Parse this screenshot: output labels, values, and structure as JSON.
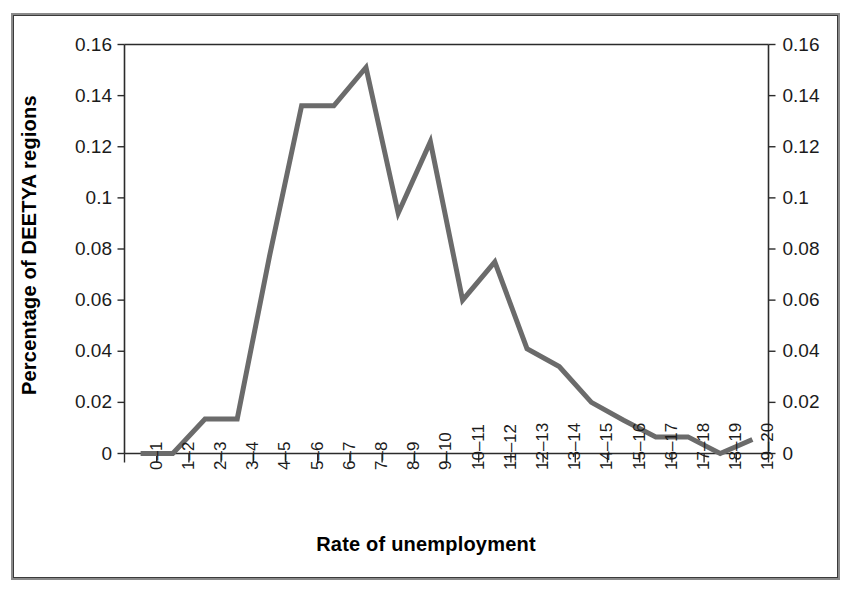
{
  "chart_data": {
    "type": "line",
    "title": "",
    "xlabel": "Rate of unemployment",
    "ylabel": "Percentage of DEETYA regions",
    "categories": [
      "0–1",
      "1–2",
      "2–3",
      "3–4",
      "4–5",
      "5–6",
      "6–7",
      "7–8",
      "8–9",
      "9–10",
      "10–11",
      "11–12",
      "12–13",
      "13–14",
      "14–15",
      "15–16",
      "16–17",
      "17–18",
      "18–19",
      "19–20"
    ],
    "values": [
      0,
      0,
      0.0135,
      0.0135,
      0.077,
      0.136,
      0.136,
      0.151,
      0.094,
      0.122,
      0.06,
      0.075,
      0.041,
      0.034,
      0.02,
      0.013,
      0.0065,
      0.0065,
      0,
      0.0055
    ],
    "series": [
      {
        "name": "Percentage of DEETYA regions",
        "values": [
          0,
          0,
          0.0135,
          0.0135,
          0.077,
          0.136,
          0.136,
          0.151,
          0.094,
          0.122,
          0.06,
          0.075,
          0.041,
          0.034,
          0.02,
          0.013,
          0.0065,
          0.0065,
          0,
          0.0055
        ],
        "color": "#6b6b6b"
      }
    ],
    "ylim": [
      0,
      0.16
    ],
    "yticks": [
      0,
      0.02,
      0.04,
      0.06,
      0.08,
      0.1,
      0.12,
      0.14,
      0.16
    ],
    "ytick_labels": [
      "0",
      "0.02",
      "0.04",
      "0.06",
      "0.08",
      "0.1",
      "0.12",
      "0.14",
      "0.16"
    ],
    "ytick_labels_right": [
      "0",
      "0.02",
      "0.04",
      "0.06",
      "0.08",
      "0.1",
      "0.12",
      "0.14",
      "0.16"
    ],
    "grid": false,
    "legend": "none",
    "dual_y_axis": true,
    "line_color": "#6b6b6b",
    "axis_color": "#2b2b2b",
    "background": "#ffffff",
    "frame_color": "#3a3a3a"
  }
}
